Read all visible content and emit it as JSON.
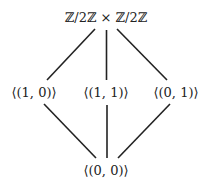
{
  "diagram": {
    "type": "subgroup-lattice",
    "nodes": [
      {
        "id": "top",
        "label": "ℤ/2ℤ × ℤ/2ℤ",
        "x": 106,
        "y": 17
      },
      {
        "id": "left",
        "label": "⟨(1, 0)⟩",
        "x": 34,
        "y": 92
      },
      {
        "id": "middle",
        "label": "⟨(1, 1)⟩",
        "x": 106,
        "y": 92
      },
      {
        "id": "right",
        "label": "⟨(0, 1)⟩",
        "x": 176,
        "y": 92
      },
      {
        "id": "bottom",
        "label": "⟨(0, 0)⟩",
        "x": 106,
        "y": 170
      }
    ],
    "edges": [
      {
        "from": "top",
        "to": "left"
      },
      {
        "from": "top",
        "to": "middle"
      },
      {
        "from": "top",
        "to": "right"
      },
      {
        "from": "left",
        "to": "bottom"
      },
      {
        "from": "middle",
        "to": "bottom"
      },
      {
        "from": "right",
        "to": "bottom"
      }
    ],
    "line_color": "#222222",
    "text_color": "#222222"
  }
}
